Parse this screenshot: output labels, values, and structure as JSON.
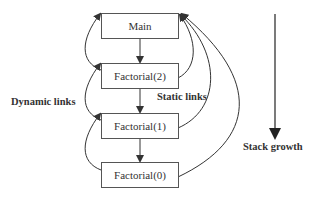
{
  "diagram": {
    "title": "",
    "frames": [
      {
        "id": "main",
        "label": "Main"
      },
      {
        "id": "factorial2",
        "label": "Factorial(2)"
      },
      {
        "id": "factorial1",
        "label": "Factorial(1)"
      },
      {
        "id": "factorial0",
        "label": "Factorial(0)"
      }
    ],
    "labels": {
      "dynamic_links": "Dynamic links",
      "static_links": "Static links",
      "stack_growth": "Stack growth"
    },
    "call_edges": [
      {
        "from": "Main",
        "to": "Factorial(2)"
      },
      {
        "from": "Factorial(2)",
        "to": "Factorial(1)"
      },
      {
        "from": "Factorial(1)",
        "to": "Factorial(0)"
      }
    ],
    "dynamic_links": [
      {
        "from": "Factorial(2)",
        "to": "Main"
      },
      {
        "from": "Factorial(1)",
        "to": "Factorial(2)"
      },
      {
        "from": "Factorial(0)",
        "to": "Factorial(1)"
      }
    ],
    "static_links": [
      {
        "from": "Factorial(2)",
        "to": "Main"
      },
      {
        "from": "Factorial(1)",
        "to": "Main"
      },
      {
        "from": "Factorial(0)",
        "to": "Main"
      }
    ],
    "colors": {
      "stroke": "#333333",
      "box_border": "#555555",
      "text": "#333333",
      "background": "#ffffff"
    }
  }
}
